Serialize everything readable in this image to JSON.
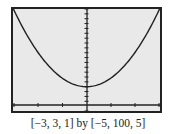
{
  "chart_data": {
    "type": "line",
    "title": "",
    "xlabel": "",
    "ylabel": "",
    "window": {
      "xmin": -3,
      "xmax": 3,
      "xscl": 1,
      "ymin": -5,
      "ymax": 100,
      "yscl": 5
    },
    "series": [
      {
        "name": "parabola",
        "description": "upward-opening parabola with vertex near (0, 20)",
        "x": [
          -3,
          -2,
          -1,
          0,
          1,
          2,
          3
        ],
        "y": [
          101,
          56,
          29,
          20,
          29,
          56,
          101
        ]
      }
    ],
    "grid": false,
    "legend": null
  },
  "caption": "[−3, 3, 1] by [−5, 100, 5]"
}
